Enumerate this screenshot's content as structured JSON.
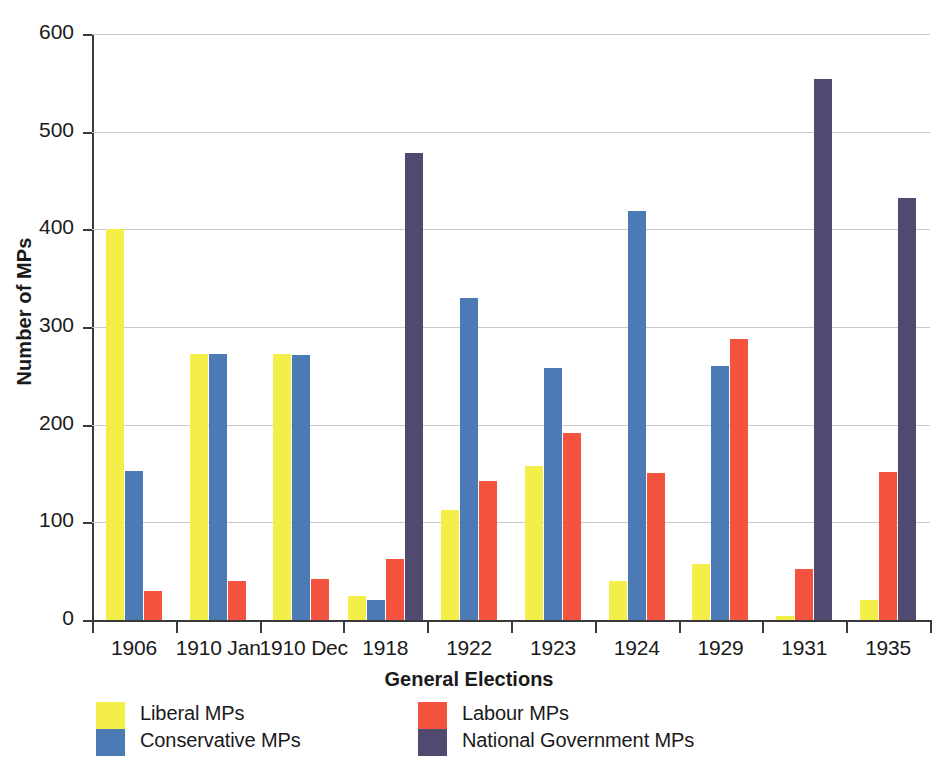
{
  "chart_data": {
    "type": "bar",
    "title": "",
    "xlabel": "General Elections",
    "ylabel": "Number of MPs",
    "ylim": [
      0,
      600
    ],
    "yticks": [
      0,
      100,
      200,
      300,
      400,
      500,
      600
    ],
    "ytick_labels": [
      "0",
      "100",
      "200",
      "300",
      "400",
      "500",
      "600"
    ],
    "grid": true,
    "legend_position": "bottom",
    "categories": [
      "1906",
      "1910 Jan",
      "1910 Dec",
      "1918",
      "1922",
      "1923",
      "1924",
      "1929",
      "1931",
      "1935"
    ],
    "series": [
      {
        "name": "Liberal MPs",
        "color": "#f4ee48",
        "values": [
          400,
          272,
          272,
          25,
          113,
          158,
          40,
          57,
          4,
          20
        ]
      },
      {
        "name": "Conservative MPs",
        "color": "#4c7ab4",
        "values": [
          153,
          272,
          271,
          21,
          330,
          258,
          419,
          260,
          null,
          null
        ]
      },
      {
        "name": "Labour MPs",
        "color": "#f4543f",
        "values": [
          30,
          40,
          42,
          62,
          142,
          191,
          151,
          288,
          52,
          152
        ]
      },
      {
        "name": "National Government MPs",
        "color": "#514a70",
        "values": [
          null,
          null,
          null,
          478,
          null,
          null,
          null,
          null,
          554,
          432
        ]
      }
    ]
  },
  "axes": {
    "y_title": "Number of MPs",
    "x_title": "General Elections"
  },
  "legend": {
    "columns": [
      {
        "entries": [
          {
            "label": "Liberal MPs",
            "color": "#f4ee48"
          },
          {
            "label": "Conservative MPs",
            "color": "#4c7ab4"
          }
        ]
      },
      {
        "entries": [
          {
            "label": "Labour MPs",
            "color": "#f4543f"
          },
          {
            "label": "National Government MPs",
            "color": "#514a70"
          }
        ]
      }
    ]
  }
}
